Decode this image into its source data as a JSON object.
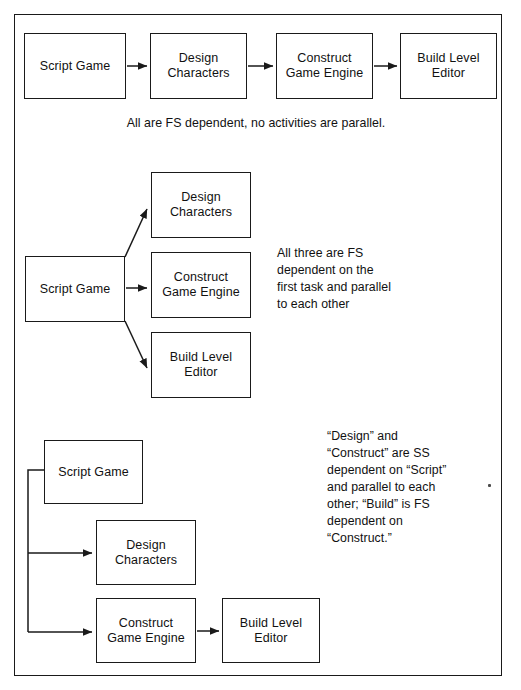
{
  "document": {
    "title": "Task Dependency Diagrams",
    "frame": {
      "border_color": "#1a1a1a",
      "background": "#ffffff"
    },
    "ink_color": "#1a1a1a"
  },
  "sections": [
    {
      "id": "section-1",
      "name": "all-fs-dependent-serial",
      "caption": "All are FS dependent, no activities are parallel.",
      "boxes": [
        {
          "id": "s1-script",
          "label": "Script Game",
          "x": 24,
          "y": 33,
          "w": 102,
          "h": 66
        },
        {
          "id": "s1-design",
          "label": "Design\nCharacters",
          "x": 150,
          "y": 33,
          "w": 97,
          "h": 66
        },
        {
          "id": "s1-construct",
          "label": "Construct\nGame Engine",
          "x": 276,
          "y": 33,
          "w": 97,
          "h": 66
        },
        {
          "id": "s1-build",
          "label": "Build Level\nEditor",
          "x": 400,
          "y": 33,
          "w": 97,
          "h": 66
        }
      ]
    },
    {
      "id": "section-2",
      "name": "fan-out-parallel-tasks",
      "caption": "All three are FS\ndependent on the\nfirst task and parallel\nto each other",
      "boxes": [
        {
          "id": "s2-script",
          "label": "Script Game",
          "x": 25,
          "y": 256,
          "w": 100,
          "h": 66
        },
        {
          "id": "s2-design",
          "label": "Design\nCharacters",
          "x": 151,
          "y": 172,
          "w": 100,
          "h": 66
        },
        {
          "id": "s2-construct",
          "label": "Construct\nGame Engine",
          "x": 151,
          "y": 252,
          "w": 100,
          "h": 66
        },
        {
          "id": "s2-build",
          "label": "Build Level\nEditor",
          "x": 151,
          "y": 332,
          "w": 100,
          "h": 66
        }
      ]
    },
    {
      "id": "section-3",
      "name": "ss-dependency-with-fs-finish",
      "caption": "“Design” and\n“Construct” are SS\ndependent on “Script”\nand parallel to each\nother; “Build” is FS\ndependent on\n“Construct.”",
      "boxes": [
        {
          "id": "s3-script",
          "label": "Script Game",
          "x": 44,
          "y": 440,
          "w": 99,
          "h": 64
        },
        {
          "id": "s3-design",
          "label": "Design\nCharacters",
          "x": 96,
          "y": 520,
          "w": 100,
          "h": 65
        },
        {
          "id": "s3-construct",
          "label": "Construct\nGame Engine",
          "x": 96,
          "y": 598,
          "w": 100,
          "h": 65
        },
        {
          "id": "s3-build",
          "label": "Build Level\nEditor",
          "x": 222,
          "y": 598,
          "w": 98,
          "h": 65
        }
      ]
    }
  ],
  "connectors": {
    "section_1": [
      {
        "name": "script-to-design",
        "type": "fs-arrow",
        "from": "s1-script",
        "to": "s1-design"
      },
      {
        "name": "design-to-construct",
        "type": "fs-arrow",
        "from": "s1-design",
        "to": "s1-construct"
      },
      {
        "name": "construct-to-build",
        "type": "fs-arrow",
        "from": "s1-construct",
        "to": "s1-build"
      }
    ],
    "section_2": [
      {
        "name": "script-to-design",
        "type": "fs-arrow-diagonal-up",
        "from": "s2-script",
        "to": "s2-design"
      },
      {
        "name": "script-to-construct",
        "type": "fs-arrow-horizontal",
        "from": "s2-script",
        "to": "s2-construct"
      },
      {
        "name": "script-to-build",
        "type": "fs-arrow-diagonal-down",
        "from": "s2-script",
        "to": "s2-build"
      }
    ],
    "section_3": [
      {
        "name": "script-to-design",
        "type": "ss-arrow-elbow",
        "from": "s3-script",
        "to": "s3-design"
      },
      {
        "name": "script-to-construct",
        "type": "ss-arrow-elbow",
        "from": "s3-script",
        "to": "s3-construct"
      },
      {
        "name": "construct-to-build",
        "type": "fs-arrow",
        "from": "s3-construct",
        "to": "s3-build"
      }
    ]
  },
  "legend": {
    "fs": "FS dependent",
    "ss": "SS dependent"
  }
}
